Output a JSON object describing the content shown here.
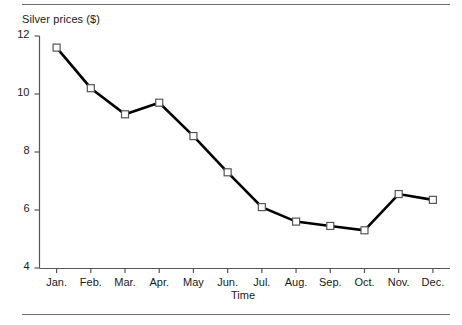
{
  "figure": {
    "top_rule": "horizontal-rule",
    "bottom_rule": "horizontal-rule"
  },
  "chart_data": {
    "type": "line",
    "title": "Silver prices ($)",
    "xlabel": "Time",
    "ylabel": "",
    "categories": [
      "Jan.",
      "Feb.",
      "Mar.",
      "Apr.",
      "May",
      "Jun.",
      "Jul.",
      "Aug.",
      "Sep.",
      "Oct.",
      "Nov.",
      "Dec."
    ],
    "values": [
      11.6,
      10.2,
      9.3,
      9.7,
      8.55,
      7.3,
      6.1,
      5.6,
      5.45,
      5.3,
      6.55,
      6.35
    ],
    "series": [
      {
        "name": "Silver prices ($)",
        "values": [
          11.6,
          10.2,
          9.3,
          9.7,
          8.55,
          7.3,
          6.1,
          5.6,
          5.45,
          5.3,
          6.55,
          6.35
        ]
      }
    ],
    "ylim": [
      4,
      12
    ],
    "yticks": [
      4,
      6,
      8,
      10,
      12
    ],
    "ytick_labels": [
      "4",
      "6",
      "8",
      "10",
      "12"
    ],
    "xtick_labels": [
      "Jan.",
      "Feb.",
      "Mar.",
      "Apr.",
      "May",
      "Jun.",
      "Jul.",
      "Aug.",
      "Sep.",
      "Oct.",
      "Nov.",
      "Dec."
    ],
    "grid": false,
    "legend": "none",
    "marker": "open-square",
    "line_color": "#000000",
    "marker_fill": "#ffffff",
    "marker_edge": "#555555",
    "axis_color": "#555555"
  }
}
